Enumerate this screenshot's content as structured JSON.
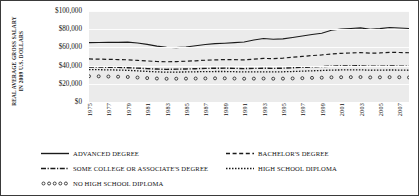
{
  "chart_data": {
    "type": "line",
    "title": "",
    "xlabel": "",
    "ylabel": "REAL AVERAGE GROSS SALARY IN 2009 U.S. DOLLARS",
    "ylabel_lines": [
      "REAL AVERAGE GROSS SALARY",
      "IN 2009 U.S. DOLLARS"
    ],
    "ylim": [
      0,
      100000
    ],
    "yticks": [
      0,
      20000,
      40000,
      60000,
      80000,
      100000
    ],
    "ytick_labels": [
      "$0",
      "$20,000",
      "$40,000",
      "$60,000",
      "$80,000",
      "$100,000"
    ],
    "grid": true,
    "legend_position": "bottom",
    "xlim": [
      1975,
      2008
    ],
    "x": [
      1975,
      1976,
      1977,
      1978,
      1979,
      1980,
      1981,
      1982,
      1983,
      1984,
      1985,
      1986,
      1987,
      1988,
      1989,
      1990,
      1991,
      1992,
      1993,
      1994,
      1995,
      1996,
      1997,
      1998,
      1999,
      2000,
      2001,
      2002,
      2003,
      2004,
      2005,
      2006,
      2007,
      2008
    ],
    "xtick_labels": [
      "1975",
      "1977",
      "1979",
      "1981",
      "1983",
      "1985",
      "1987",
      "1989",
      "1991",
      "1993",
      "1995",
      "1997",
      "1999",
      "2001",
      "2003",
      "2005",
      "2007"
    ],
    "series": [
      {
        "name": "ADVANCED DEGREE",
        "style": "solid",
        "color": "#1a1a1a",
        "values": [
          65200,
          65400,
          65600,
          65500,
          65800,
          64900,
          63300,
          61400,
          60100,
          59800,
          60500,
          61900,
          63200,
          64100,
          64600,
          65200,
          65900,
          68200,
          69700,
          68900,
          69400,
          70900,
          72600,
          74100,
          75600,
          78900,
          80300,
          80800,
          81400,
          79800,
          80600,
          81900,
          81400,
          80700
        ]
      },
      {
        "name": "BACHELOR'S DEGREE",
        "style": "dashed",
        "color": "#1a1a1a",
        "values": [
          47300,
          47100,
          46900,
          46600,
          46400,
          45700,
          45100,
          44500,
          44200,
          44400,
          44800,
          45300,
          45900,
          46300,
          46600,
          46500,
          46300,
          47100,
          47900,
          47600,
          48200,
          49200,
          50100,
          51000,
          51700,
          52800,
          53500,
          53900,
          54300,
          53600,
          53900,
          54600,
          54400,
          54100
        ]
      },
      {
        "name": "SOME COLLEGE OR ASSOCIATE'S DEGREE",
        "style": "dashdot",
        "color": "#1a1a1a",
        "values": [
          38300,
          38500,
          38200,
          38000,
          37700,
          37200,
          36700,
          36200,
          35900,
          36100,
          36300,
          36600,
          36900,
          37100,
          37200,
          37000,
          36700,
          36900,
          37100,
          36900,
          37200,
          37600,
          38100,
          38600,
          38900,
          39400,
          39600,
          39700,
          39800,
          39200,
          39300,
          39600,
          39400,
          39200
        ]
      },
      {
        "name": "HIGH SCHOOL DIPLOMA",
        "style": "dotted",
        "color": "#1a1a1a",
        "values": [
          35600,
          35500,
          35300,
          35100,
          34800,
          34200,
          33600,
          33100,
          32800,
          32900,
          33000,
          33200,
          33400,
          33500,
          33500,
          33300,
          33000,
          33100,
          33200,
          33000,
          33200,
          33500,
          33900,
          34300,
          34600,
          35100,
          35200,
          35300,
          35400,
          34900,
          35000,
          35200,
          35100,
          34900
        ]
      },
      {
        "name": "NO HIGH SCHOOL DIPLOMA",
        "style": "circles",
        "color": "#1a1a1a",
        "values": [
          28300,
          28200,
          28000,
          27800,
          27500,
          26900,
          26300,
          25800,
          25500,
          25600,
          25700,
          25800,
          25900,
          26000,
          26000,
          25800,
          25600,
          25700,
          25800,
          25600,
          25700,
          25900,
          26200,
          26500,
          26700,
          27100,
          27200,
          27300,
          27400,
          27000,
          27100,
          27300,
          27200,
          27000
        ]
      }
    ],
    "legend_entries": [
      {
        "label": "ADVANCED DEGREE",
        "style": "solid"
      },
      {
        "label": "BACHELOR'S DEGREE",
        "style": "dashed"
      },
      {
        "label": "SOME COLLEGE OR ASSOCIATE'S DEGREE",
        "style": "dashdot"
      },
      {
        "label": "HIGH SCHOOL DIPLOMA",
        "style": "dotted"
      },
      {
        "label": "NO HIGH SCHOOL DIPLOMA",
        "style": "circles"
      }
    ]
  }
}
